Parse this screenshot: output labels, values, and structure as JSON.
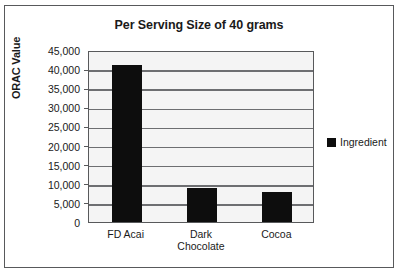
{
  "chart_data": {
    "type": "bar",
    "title": "Per Serving Size of 40 grams",
    "xlabel": "",
    "ylabel": "ORAC Value",
    "categories": [
      "FD Acai",
      "Dark Chocolate",
      "Cocoa"
    ],
    "category_lines": [
      [
        "FD Acai"
      ],
      [
        "Dark",
        "Chocolate"
      ],
      [
        "Cocoa"
      ]
    ],
    "values": [
      41200,
      9000,
      7800
    ],
    "series": [
      {
        "name": "Ingredient",
        "values": [
          41200,
          9000,
          7800
        ],
        "color": "#0d0d0d"
      }
    ],
    "ylim": [
      0,
      45000
    ],
    "ytick_step": 5000,
    "ytick_labels": [
      "45,000",
      "40,000",
      "35,000",
      "30,000",
      "25,000",
      "20,000",
      "15,000",
      "10,000",
      "5,000",
      "0"
    ],
    "ytick_values": [
      45000,
      40000,
      35000,
      30000,
      25000,
      20000,
      15000,
      10000,
      5000,
      0
    ],
    "grid": true,
    "grid_axis": "y",
    "legend_position": "right",
    "legend_entries": [
      "Ingredient"
    ],
    "plot_background": "#f4f4f4",
    "gridline_color": "#6d6e71",
    "border_color": "#58595b"
  },
  "legend": {
    "marker_name": "legend-color-swatch",
    "label": "Ingredient"
  }
}
